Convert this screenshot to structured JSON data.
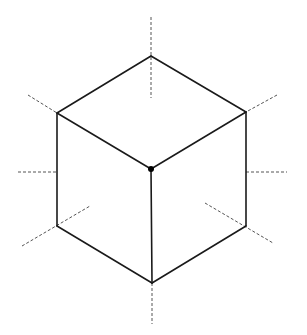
{
  "diagram": {
    "title": "",
    "type": "isometric-cube",
    "colors": {
      "background": "#ffffff",
      "edge": "#1a1a1a",
      "dashed": "#555555",
      "vertex": "#000000"
    },
    "vertices": {
      "top": [
        151,
        56
      ],
      "upper_left": [
        57,
        113
      ],
      "upper_right": [
        246,
        112
      ],
      "center": [
        151,
        169
      ],
      "lower_left": [
        57,
        226
      ],
      "lower_right": [
        246,
        226
      ],
      "bottom": [
        152,
        283
      ]
    },
    "solid_edges": [
      [
        "top",
        "upper_left"
      ],
      [
        "top",
        "upper_right"
      ],
      [
        "upper_left",
        "center"
      ],
      [
        "upper_right",
        "center"
      ],
      [
        "upper_left",
        "lower_left"
      ],
      [
        "upper_right",
        "lower_right"
      ],
      [
        "center",
        "bottom"
      ],
      [
        "lower_left",
        "bottom"
      ],
      [
        "lower_right",
        "bottom"
      ]
    ],
    "dashed_lines": [
      [
        [
          151,
          17
        ],
        [
          151,
          98
        ]
      ],
      [
        [
          28,
          95
        ],
        [
          57,
          113
        ]
      ],
      [
        [
          277,
          95
        ],
        [
          246,
          112
        ]
      ],
      [
        [
          18,
          172
        ],
        [
          57,
          172
        ]
      ],
      [
        [
          246,
          172
        ],
        [
          287,
          172
        ]
      ],
      [
        [
          22,
          246
        ],
        [
          90,
          206
        ]
      ],
      [
        [
          205,
          203
        ],
        [
          273,
          243
        ]
      ],
      [
        [
          152,
          283
        ],
        [
          152,
          324
        ]
      ]
    ],
    "center_dot_radius": 3
  }
}
